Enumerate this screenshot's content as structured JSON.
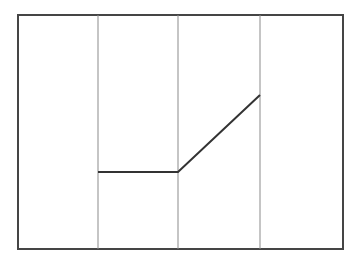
{
  "canvas": {
    "width": 358,
    "height": 258,
    "background": "#ffffff"
  },
  "diagram": {
    "outer_frame": {
      "x": 18,
      "y": 15,
      "width": 325,
      "height": 234,
      "stroke": "#454545",
      "stroke_width": 2
    },
    "divider_style": {
      "stroke": "#8b8b8b",
      "stroke_width": 1
    },
    "dividers": [
      {
        "x": 98,
        "y1": 15,
        "y2": 249
      },
      {
        "x": 178,
        "y1": 15,
        "y2": 249
      },
      {
        "x": 260,
        "y1": 15,
        "y2": 249
      }
    ],
    "signal_path": {
      "points": [
        [
          98,
          172
        ],
        [
          178,
          172
        ],
        [
          260,
          95
        ]
      ],
      "stroke": "#333333",
      "stroke_width": 2
    }
  }
}
